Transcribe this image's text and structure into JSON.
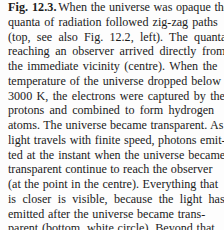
{
  "document": {
    "type": "figure-caption",
    "figure_label": "Fig. 12.3.",
    "full_text": "Fig. 12.3. When the universe was opaque the quanta of radiation followed zig-zag paths (top, see also Fig. 12.2, left). The quanta reaching an observer arrived directly from the immediate vicinity (centre). When the temperature of the universe dropped below 3000 K, the electrons were captured by the protons and combined to form hydrogen atoms. The universe became transparent. As light travels with finite speed, photons emitted at the instant when the universe became transparent continue to reach the observer (at the point in the centre). Everything that is closer is visible, because the light has been emitted after the universe became transparent (bottom, white circle). Beyond that, nothing can be seen",
    "background_color": "#fdfdfd",
    "text_color": "#1b1b1b",
    "lines": [
      "When the universe was opaque the",
      "quanta of radiation followed zig-zag paths",
      "(top, see also Fig. 12.2, left). The quanta",
      "reaching an observer arrived directly from",
      "the immediate vicinity (centre). When the",
      "temperature of the universe dropped below",
      "3000 K, the electrons were captured by the",
      "protons and combined to form hydrogen",
      "atoms. The universe became transparent. As",
      "light travels with finite speed, photons emit-",
      "ted at the instant when the universe became",
      "transparent continue to reach the observer",
      "(at the point in the centre). Everything that",
      "is closer is visible, because the light has been",
      "emitted after the universe became trans-",
      "parent (bottom, white circle). Beyond that,",
      "nothing can be seen"
    ]
  }
}
